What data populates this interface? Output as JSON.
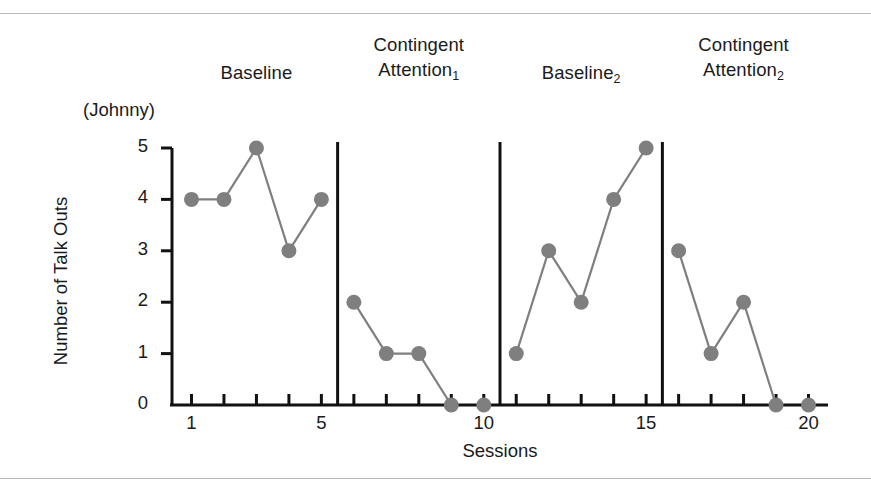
{
  "figure": {
    "subject_label": "(Johnny)",
    "has_top_rule": true,
    "has_bottom_rule": true,
    "rule_color": "#b9b9b9"
  },
  "phases": [
    {
      "name": "Baseline",
      "subscript": "",
      "sessions": [
        1,
        2,
        3,
        4,
        5
      ]
    },
    {
      "name": "Contingent\nAttention",
      "subscript": "1",
      "sessions": [
        6,
        7,
        8,
        9,
        10
      ]
    },
    {
      "name": "Baseline",
      "subscript": "2",
      "sessions": [
        11,
        12,
        13,
        14,
        15
      ]
    },
    {
      "name": "Contingent\nAttention",
      "subscript": "2",
      "sessions": [
        16,
        17,
        18,
        19,
        20
      ]
    }
  ],
  "chart_data": {
    "type": "line",
    "title": "",
    "subtitle": "(Johnny)",
    "xlabel": "Sessions",
    "ylabel": "Number of Talk Outs",
    "xlim": [
      0.4,
      20.6
    ],
    "ylim": [
      0,
      5
    ],
    "xticks": [
      1,
      2,
      3,
      4,
      5,
      6,
      7,
      8,
      9,
      10,
      11,
      12,
      13,
      14,
      15,
      16,
      17,
      18,
      19,
      20
    ],
    "xtick_labels_shown": [
      "1",
      "5",
      "10",
      "15",
      "20"
    ],
    "xtick_labels_shown_at": [
      1,
      5,
      10,
      15,
      20
    ],
    "yticks": [
      0,
      1,
      2,
      3,
      4,
      5
    ],
    "ytick_labels": [
      "0",
      "1",
      "2",
      "3",
      "4",
      "5"
    ],
    "grid": false,
    "legend": "none",
    "marker": "circle",
    "marker_color": "#7f7f7f",
    "line_color": "#7f7f7f",
    "axis_color": "#111111",
    "phase_divider_color": "#111111",
    "phase_dividers_after_session": [
      5,
      10,
      15
    ],
    "x": [
      1,
      2,
      3,
      4,
      5,
      6,
      7,
      8,
      9,
      10,
      11,
      12,
      13,
      14,
      15,
      16,
      17,
      18,
      19,
      20
    ],
    "values": [
      4,
      4,
      5,
      3,
      4,
      2,
      1,
      1,
      0,
      0,
      1,
      3,
      2,
      4,
      5,
      3,
      1,
      2,
      0,
      0
    ],
    "series": [
      {
        "name": "Baseline",
        "x": [
          1,
          2,
          3,
          4,
          5
        ],
        "values": [
          4,
          4,
          5,
          3,
          4
        ]
      },
      {
        "name": "Contingent Attention 1",
        "x": [
          6,
          7,
          8,
          9,
          10
        ],
        "values": [
          2,
          1,
          1,
          0,
          0
        ],
        "connected_x": [
          6,
          7,
          8,
          9
        ],
        "isolated_points_x": [
          10
        ]
      },
      {
        "name": "Baseline 2",
        "x": [
          11,
          12,
          13,
          14,
          15
        ],
        "values": [
          1,
          3,
          2,
          4,
          5
        ]
      },
      {
        "name": "Contingent Attention 2",
        "x": [
          16,
          17,
          18,
          19,
          20
        ],
        "values": [
          3,
          1,
          2,
          0,
          0
        ],
        "connected_x": [
          16,
          17,
          18,
          19
        ],
        "isolated_points_x": [
          20
        ]
      }
    ]
  }
}
